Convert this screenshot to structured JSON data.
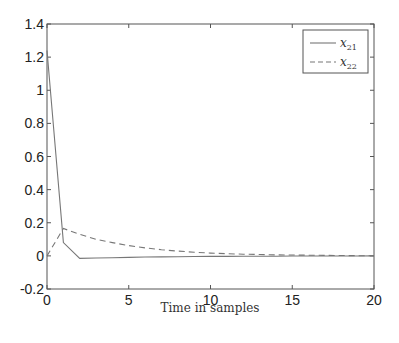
{
  "chart_data": {
    "type": "line",
    "title": "",
    "xlabel": "Time in samples",
    "ylabel": "",
    "xlim": [
      0,
      20
    ],
    "ylim": [
      -0.2,
      1.4
    ],
    "xticks": [
      0,
      5,
      10,
      15,
      20
    ],
    "xtick_labels": [
      "0",
      "5",
      "10",
      "15",
      "20"
    ],
    "yticks": [
      -0.2,
      0,
      0.2,
      0.4,
      0.6,
      0.8,
      1,
      1.2,
      1.4
    ],
    "ytick_labels": [
      "-0.2",
      "0",
      "0.2",
      "0.4",
      "0.6",
      "0.8",
      "1",
      "1.2",
      "1.4"
    ],
    "grid": false,
    "legend_position": "upper right",
    "x": [
      0,
      1,
      2,
      3,
      4,
      5,
      6,
      7,
      8,
      9,
      10,
      11,
      12,
      13,
      14,
      15,
      16,
      17,
      18,
      19,
      20
    ],
    "series": [
      {
        "name": "x21",
        "legend_base": "x",
        "legend_sub": "21",
        "style": "solid",
        "color": "#777777",
        "values": [
          1.24,
          0.08,
          -0.015,
          -0.013,
          -0.011,
          -0.009,
          -0.007,
          -0.006,
          -0.005,
          -0.004,
          -0.003,
          -0.003,
          -0.002,
          -0.002,
          -0.002,
          -0.001,
          -0.001,
          -0.001,
          -0.001,
          -0.001,
          0.0
        ]
      },
      {
        "name": "x22",
        "legend_base": "x",
        "legend_sub": "22",
        "style": "dashed",
        "color": "#777777",
        "values": [
          0.0,
          0.165,
          0.13,
          0.1,
          0.08,
          0.062,
          0.048,
          0.037,
          0.029,
          0.022,
          0.017,
          0.013,
          0.01,
          0.008,
          0.006,
          0.005,
          0.004,
          0.003,
          0.002,
          0.001,
          0.001
        ]
      }
    ]
  },
  "plot": {
    "axis_color": "#555555",
    "background": "#ffffff"
  }
}
